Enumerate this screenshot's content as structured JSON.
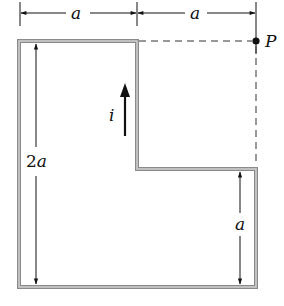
{
  "diagram": {
    "type": "L-shaped current loop",
    "labels": {
      "top_left_width": "a",
      "top_right_width": "a",
      "point": "P",
      "current": "i",
      "left_height_num": "2",
      "left_height_var": "a",
      "right_height": "a"
    },
    "colors": {
      "wire": "#8a8a8a",
      "wire_inner": "#c8c8c8",
      "ink": "#111111",
      "dashed": "#333333",
      "background": "#ffffff"
    }
  }
}
